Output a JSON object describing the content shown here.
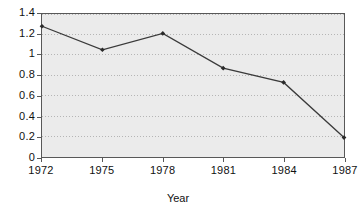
{
  "chart_data": {
    "type": "line",
    "title": "",
    "xlabel": "Year",
    "ylabel": "",
    "x": [
      1972,
      1975,
      1978,
      1981,
      1984,
      1987
    ],
    "values": [
      1.28,
      1.05,
      1.21,
      0.87,
      0.73,
      0.19
    ],
    "series": [
      {
        "name": "",
        "values": [
          1.28,
          1.05,
          1.21,
          0.87,
          0.73,
          0.19
        ]
      }
    ],
    "xlim": [
      1972,
      1987
    ],
    "ylim": [
      0,
      1.4
    ],
    "xticks": [
      1972,
      1975,
      1978,
      1981,
      1984,
      1987
    ],
    "xtick_labels": [
      "1972",
      "1975",
      "1978",
      "1981",
      "1984",
      "1987"
    ],
    "yticks": [
      0,
      0.2,
      0.4,
      0.6,
      0.8,
      1,
      1.2,
      1.4
    ],
    "ytick_labels": [
      "0",
      "0.2",
      "0.4",
      "0.6",
      "0.8",
      "1",
      "1.2",
      "1.4"
    ],
    "grid": {
      "horizontal": true,
      "vertical": false,
      "style": "dotted",
      "color": "#b4b4b4"
    },
    "legend": null,
    "legend_position": "none",
    "markers": "filled-diamond",
    "line_color": "#3a3a3a",
    "marker_color": "#2a2a2a",
    "plot_background": "#ebebeb",
    "figure_background": "#ffffff",
    "axis_color": "#585858"
  }
}
